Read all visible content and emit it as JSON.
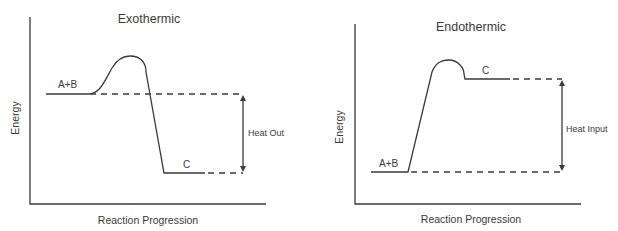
{
  "colors": {
    "line": "#3a3a3a",
    "text": "#3a3a3a",
    "background": "#ffffff"
  },
  "exothermic": {
    "title": "Exothermic",
    "x_axis_label": "Reaction Progression",
    "y_axis_label": "Energy",
    "reactants_label": "A+B",
    "products_label": "C",
    "energy_change_label": "Heat Out"
  },
  "endothermic": {
    "title": "Endothermic",
    "x_axis_label": "Reaction Progression",
    "y_axis_label": "Energy",
    "reactants_label": "A+B",
    "products_label": "C",
    "energy_change_label": "Heat Input"
  }
}
